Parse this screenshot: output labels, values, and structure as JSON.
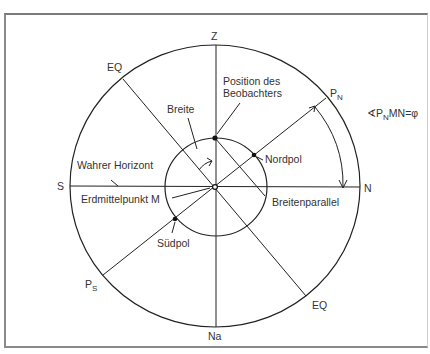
{
  "diagram": {
    "type": "geographic-latitude-celestial-sphere",
    "colors": {
      "line": "#222222",
      "text": "#333333",
      "frame": "#8a8a8a",
      "background": "#ffffff"
    },
    "labels": {
      "zenith": "Z",
      "nadir": "Na",
      "south": "S",
      "north": "N",
      "equator_top": "EQ",
      "equator_bottom": "EQ",
      "celestial_north_pole": {
        "main": "P",
        "sub": "N"
      },
      "celestial_south_pole": {
        "main": "P",
        "sub": "S"
      },
      "observer_position_line1": "Position des",
      "observer_position_line2": "Beobachters",
      "latitude": "Breite",
      "north_pole": "Nordpol",
      "south_pole": "Südpol",
      "true_horizon": "Wahrer Horizont",
      "earth_center": "Erdmittelpunkt M",
      "parallel_of_latitude": "Breitenparallel",
      "angle_formula": {
        "angle_sign": "∢",
        "p": "P",
        "sub": "N",
        "rest": "MN=φ"
      }
    }
  }
}
